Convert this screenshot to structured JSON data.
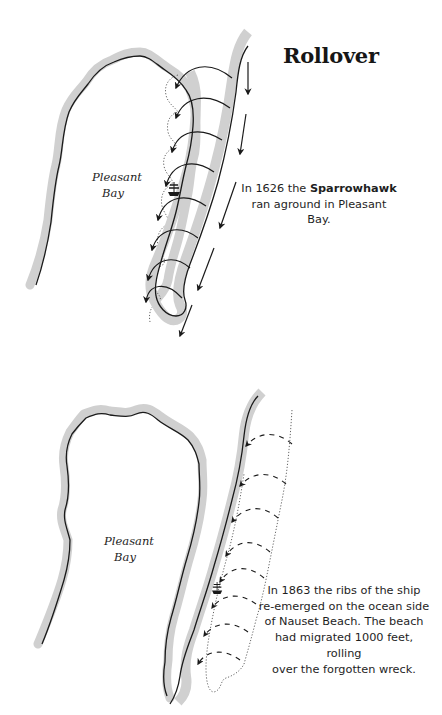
{
  "title": "Rollover",
  "panels": [
    {
      "id": "panel-1626",
      "bay_label_line1": "Pleasant",
      "bay_label_line2": "Bay",
      "caption_prefix": "In 1626 the ",
      "caption_bold": "Sparrowhawk",
      "caption_suffix": "ran aground in Pleasant Bay."
    },
    {
      "id": "panel-1863",
      "bay_label_line1": "Pleasant",
      "bay_label_line2": "Bay",
      "caption_lines": [
        "In 1863 the ribs of the ship",
        "re-emerged on the ocean side",
        "of Nauset Beach. The beach",
        "had migrated 1000 feet, rolling",
        "over the forgotten wreck."
      ]
    }
  ],
  "colors": {
    "shoreline": "#1a1a1a",
    "shore_band": "#cfcfcf",
    "background": "#ffffff"
  },
  "icons": [
    "ship-icon",
    "arrow-icon"
  ]
}
